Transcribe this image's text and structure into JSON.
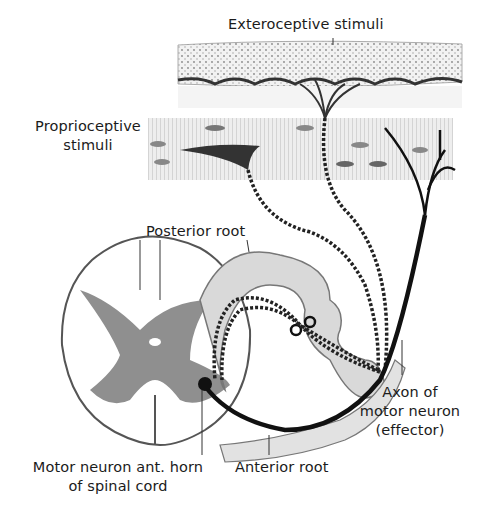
{
  "figure": {
    "type": "reflex-arc-diagram",
    "colors": {
      "ink": "#1b1b1b",
      "gray_matter": "#8f8f8f",
      "nerve_sheath": "#d9d9d9",
      "tissue": "#e6e6e6",
      "background": "#ffffff"
    }
  },
  "labels": {
    "exteroceptive": "Exteroceptive stimuli",
    "proprioceptive_line1": "Proprioceptive",
    "proprioceptive_line2": "stimuli",
    "posterior_root": "Posterior root",
    "axon_line1": "Axon of",
    "axon_line2": "motor neuron",
    "axon_line3": "(effector)",
    "motor_neuron_line1": "Motor neuron ant. horn",
    "motor_neuron_line2": "of spinal cord",
    "anterior_root": "Anterior root"
  }
}
